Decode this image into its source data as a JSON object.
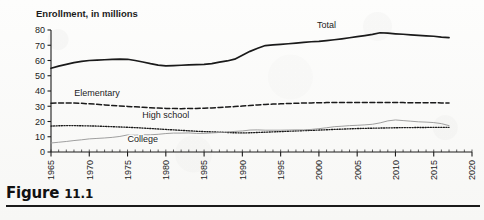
{
  "figure": {
    "caption_word": "Figure",
    "caption_number": "11.1"
  },
  "chart_data": {
    "type": "line",
    "title": "Enrollment, in millions",
    "xlabel": "",
    "ylabel": "",
    "xlim": [
      1965,
      2020
    ],
    "ylim": [
      0,
      80
    ],
    "yticks": [
      0,
      10,
      20,
      30,
      40,
      50,
      60,
      70,
      80
    ],
    "xticks": [
      1965,
      1970,
      1975,
      1980,
      1985,
      1990,
      1995,
      2000,
      2005,
      2010,
      2015,
      2020
    ],
    "xtick_labels": [
      "1965",
      "1970",
      "1975",
      "1980",
      "1985",
      "1990",
      "1995",
      "2000",
      "2005",
      "2010",
      "2015",
      "2020"
    ],
    "ytick_labels": [
      "0",
      "10",
      "20",
      "30",
      "40",
      "50",
      "60",
      "70",
      "80"
    ],
    "xtick_minor_interval": 1,
    "grid": false,
    "legend": "inline-labels",
    "x": [
      1965,
      1966,
      1967,
      1968,
      1969,
      1970,
      1971,
      1972,
      1973,
      1974,
      1975,
      1976,
      1977,
      1978,
      1979,
      1980,
      1981,
      1982,
      1983,
      1984,
      1985,
      1986,
      1987,
      1988,
      1989,
      1990,
      1991,
      1992,
      1993,
      1994,
      1995,
      1996,
      1997,
      1998,
      1999,
      2000,
      2001,
      2002,
      2003,
      2004,
      2005,
      2006,
      2007,
      2008,
      2009,
      2010,
      2011,
      2012,
      2013,
      2014,
      2015,
      2016,
      2017
    ],
    "series": [
      {
        "name": "Total",
        "style": "solid",
        "color": "#1a1a1a",
        "label_x": 2001,
        "label_y": 81,
        "values": [
          54.9,
          56.3,
          57.5,
          58.6,
          59.4,
          60.0,
          60.3,
          60.5,
          60.7,
          60.9,
          60.8,
          60.0,
          59.0,
          57.9,
          57.0,
          56.5,
          56.7,
          56.9,
          57.1,
          57.3,
          57.5,
          58.0,
          58.9,
          59.7,
          60.9,
          63.5,
          66.0,
          68.0,
          69.8,
          70.2,
          70.6,
          71.0,
          71.4,
          71.9,
          72.3,
          72.5,
          73.0,
          73.6,
          74.2,
          74.9,
          75.6,
          76.3,
          77.1,
          78.2,
          77.9,
          77.5,
          77.2,
          76.8,
          76.5,
          76.2,
          75.9,
          75.3,
          75.0
        ]
      },
      {
        "name": "Elementary",
        "style": "dashed",
        "color": "#1a1a1a",
        "label_x": 1971,
        "label_y": 37,
        "values": [
          32.0,
          32.2,
          32.2,
          32.1,
          31.9,
          31.6,
          31.3,
          30.9,
          30.5,
          30.2,
          29.9,
          29.6,
          29.3,
          29.0,
          28.8,
          28.6,
          28.5,
          28.4,
          28.5,
          28.6,
          28.7,
          28.9,
          29.2,
          29.5,
          29.8,
          30.1,
          30.5,
          30.9,
          31.2,
          31.4,
          31.6,
          31.8,
          32.0,
          32.1,
          32.2,
          32.3,
          32.4,
          32.4,
          32.4,
          32.4,
          32.4,
          32.4,
          32.4,
          32.4,
          32.4,
          32.4,
          32.4,
          32.3,
          32.3,
          32.3,
          32.3,
          32.2,
          32.2
        ]
      },
      {
        "name": "High school",
        "style": "dotted",
        "color": "#1a1a1a",
        "label_x": 1980,
        "label_y": 22,
        "values": [
          17.0,
          17.2,
          17.3,
          17.3,
          17.2,
          17.1,
          17.0,
          16.8,
          16.6,
          16.4,
          16.2,
          16.0,
          15.7,
          15.4,
          15.1,
          14.8,
          14.5,
          14.2,
          13.9,
          13.6,
          13.4,
          13.2,
          13.0,
          12.8,
          12.6,
          12.5,
          12.6,
          12.8,
          13.0,
          13.2,
          13.4,
          13.6,
          13.8,
          14.0,
          14.2,
          14.4,
          14.6,
          14.8,
          15.0,
          15.2,
          15.4,
          15.5,
          15.6,
          15.7,
          15.8,
          15.9,
          16.0,
          16.0,
          16.1,
          16.1,
          16.2,
          16.2,
          16.2
        ]
      },
      {
        "name": "College",
        "style": "thin-solid",
        "color": "#9a9a9a",
        "label_x": 1977,
        "label_y": 6.5,
        "values": [
          5.9,
          6.4,
          6.9,
          7.5,
          8.0,
          8.6,
          8.9,
          9.2,
          9.6,
          10.2,
          11.2,
          11.0,
          11.3,
          11.3,
          11.6,
          12.1,
          12.4,
          12.4,
          12.5,
          12.2,
          12.2,
          12.5,
          12.8,
          13.1,
          13.5,
          13.8,
          14.4,
          14.5,
          14.3,
          14.3,
          14.3,
          14.4,
          14.5,
          14.5,
          14.8,
          15.3,
          15.9,
          16.6,
          16.9,
          17.3,
          17.5,
          17.8,
          18.2,
          19.1,
          20.4,
          21.0,
          20.6,
          20.2,
          19.8,
          19.6,
          19.3,
          18.6,
          17.3
        ]
      }
    ]
  }
}
